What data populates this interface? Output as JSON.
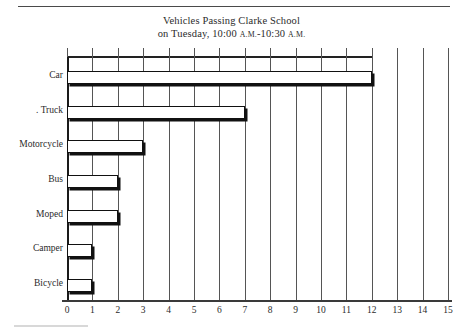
{
  "chart_data": {
    "type": "bar",
    "orientation": "horizontal",
    "title": "Vehicles Passing Clarke School",
    "subtitle_parts": {
      "lead": "on Tuesday, 10:00 ",
      "am1": "A.M.",
      "dash": "-10:30 ",
      "am2": "A.M."
    },
    "subtitle": "on Tuesday, 10:00 A.M.-10:30 A.M.",
    "categories": [
      "Car",
      "Truck",
      "Motorcycle",
      "Bus",
      "Moped",
      "Camper",
      "Bicycle"
    ],
    "category_labels": [
      "Car",
      ". Truck",
      "Motorcycle",
      "Bus",
      "Moped",
      "Camper",
      "Bicycle"
    ],
    "values": [
      12,
      7,
      3,
      2,
      2,
      1,
      1
    ],
    "xlabel": "",
    "ylabel": "",
    "xlim": [
      0,
      15
    ],
    "xticks": [
      0,
      1,
      2,
      3,
      4,
      5,
      6,
      7,
      8,
      9,
      10,
      11,
      12,
      13,
      14,
      15
    ],
    "xtick_labels": [
      "0",
      "1",
      "2",
      "3",
      "4",
      "5",
      "6",
      "7",
      "8",
      "9",
      "10",
      "11",
      "12",
      "13",
      "14",
      "15"
    ],
    "grid": "vertical",
    "legend": null,
    "bar_fill": "#ffffff",
    "bar_outline": "#111111",
    "gridline_color": "#555555",
    "axis_color": "#222222",
    "text_color": "#2b2b2b"
  }
}
